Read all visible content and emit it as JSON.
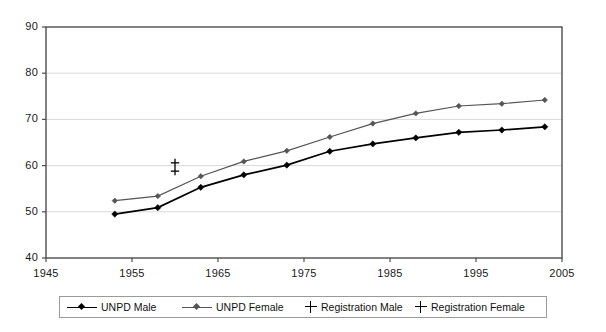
{
  "chart_data": {
    "type": "line",
    "title": "",
    "xlabel": "",
    "ylabel": "",
    "xlim": [
      1945,
      2005
    ],
    "ylim": [
      40,
      90
    ],
    "xticks": [
      1945,
      1955,
      1965,
      1975,
      1985,
      1995,
      2005
    ],
    "yticks": [
      40,
      50,
      60,
      70,
      80,
      90
    ],
    "grid": true,
    "grid_axis": "y",
    "legend_position": "bottom",
    "series": [
      {
        "name": "UNPD Male",
        "marker": "diamond",
        "color": "#000000",
        "x": [
          1953,
          1958,
          1963,
          1968,
          1973,
          1978,
          1983,
          1988,
          1993,
          1998,
          2003
        ],
        "values": [
          49.5,
          50.9,
          55.3,
          58.0,
          60.1,
          63.1,
          64.7,
          66.0,
          67.2,
          67.7,
          68.4
        ]
      },
      {
        "name": "UNPD Female",
        "marker": "diamond",
        "color": "#555555",
        "x": [
          1953,
          1958,
          1963,
          1968,
          1973,
          1978,
          1983,
          1988,
          1993,
          1998,
          2003
        ],
        "values": [
          52.4,
          53.4,
          57.7,
          60.9,
          63.2,
          66.2,
          69.1,
          71.3,
          72.9,
          73.4,
          74.2
        ]
      },
      {
        "name": "Registration Male",
        "marker": "plus",
        "color": "#000000",
        "x": [
          1960
        ],
        "values": [
          58.8
        ]
      },
      {
        "name": "Registration Female",
        "marker": "plus",
        "color": "#000000",
        "x": [
          1960
        ],
        "values": [
          60.6
        ]
      }
    ]
  },
  "legend": {
    "items": [
      {
        "label": "UNPD Male",
        "marker": "line-diamond",
        "color": "#000000"
      },
      {
        "label": "UNPD Female",
        "marker": "line-diamond",
        "color": "#555555"
      },
      {
        "label": "Registration Male",
        "marker": "plus",
        "color": "#000000"
      },
      {
        "label": "Registration Female",
        "marker": "plus",
        "color": "#000000"
      }
    ]
  },
  "axes": {
    "y_tick_labels": [
      "90",
      "80",
      "70",
      "60",
      "50",
      "40"
    ],
    "x_tick_labels": [
      "1945",
      "1955",
      "1965",
      "1975",
      "1985",
      "1995",
      "2005"
    ]
  },
  "colors": {
    "plot_border": "#4d4d4d",
    "gridline": "#d9d9d9",
    "male_line": "#000000",
    "female_line": "#555555",
    "background": "#ffffff"
  }
}
